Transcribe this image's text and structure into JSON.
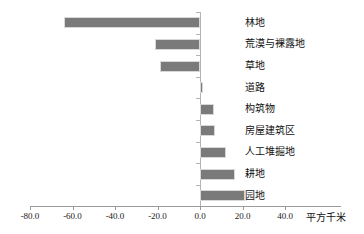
{
  "chart_data": {
    "type": "bar",
    "orientation": "horizontal",
    "title": "",
    "xlabel": "平方千米",
    "ylabel": "",
    "categories": [
      "林地",
      "荒漠与裸露地",
      "草地",
      "道路",
      "构筑物",
      "房屋建筑区",
      "人工堆掘地",
      "耕地",
      "园地"
    ],
    "values": [
      -64.2,
      -21.3,
      -18.8,
      1.5,
      6.6,
      7.0,
      12.3,
      16.6,
      21.3
    ],
    "xlim": [
      -80.0,
      40.0
    ],
    "xticks": [
      -80.0,
      -60.0,
      -40.0,
      -20.0,
      0.0,
      20.0,
      40.0
    ],
    "xtick_labels": [
      "-80.0",
      "-60.0",
      "-40.0",
      "-20.0",
      "0.0",
      "20.0",
      "40.0"
    ],
    "grid": false,
    "legend": null,
    "bar_color": "#7a7a7a",
    "axis_color": "#9a9a9a",
    "category_label_position": "right"
  }
}
